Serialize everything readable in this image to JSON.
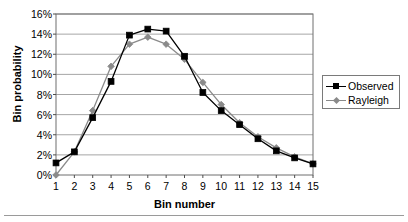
{
  "chart_data": {
    "type": "line",
    "title": "",
    "xlabel": "Bin number",
    "ylabel": "Bin probability",
    "x": [
      1,
      2,
      3,
      4,
      5,
      6,
      7,
      8,
      9,
      10,
      11,
      12,
      13,
      14,
      15
    ],
    "categories": [
      "1",
      "2",
      "3",
      "4",
      "5",
      "6",
      "7",
      "8",
      "9",
      "10",
      "11",
      "12",
      "13",
      "14",
      "15"
    ],
    "xlim": [
      1,
      15
    ],
    "ylim": [
      0,
      16
    ],
    "ytick_labels": [
      "0%",
      "2%",
      "4%",
      "6%",
      "8%",
      "10%",
      "12%",
      "14%",
      "16%"
    ],
    "ytick_values": [
      0,
      2,
      4,
      6,
      8,
      10,
      12,
      14,
      16
    ],
    "grid": "horizontal",
    "legend_position": "right",
    "series": [
      {
        "name": "Observed",
        "color": "#000000",
        "marker": "square",
        "values": [
          1.2,
          2.3,
          5.7,
          9.3,
          13.9,
          14.5,
          14.3,
          11.8,
          8.2,
          6.4,
          5.0,
          3.6,
          2.4,
          1.7,
          1.1
        ]
      },
      {
        "name": "Rayleigh",
        "color": "#8a8a8a",
        "marker": "diamond",
        "values": [
          0.0,
          2.3,
          6.4,
          10.8,
          13.0,
          13.7,
          13.0,
          11.5,
          9.2,
          7.0,
          5.2,
          3.8,
          2.7,
          1.8,
          1.1
        ]
      }
    ]
  },
  "axes": {
    "ylabel": "Bin probability",
    "xlabel": "Bin number"
  },
  "legend": {
    "items": [
      {
        "label": "Observed",
        "marker": "square-marker-icon",
        "color": "#000000"
      },
      {
        "label": "Rayleigh",
        "marker": "diamond-marker-icon",
        "color": "#8a8a8a"
      }
    ]
  },
  "colors": {
    "observed": "#000000",
    "rayleigh": "#8a8a8a",
    "grid": "#a6a6a6",
    "frame": "#6f6f6f",
    "rule": "#9a9a9a"
  }
}
